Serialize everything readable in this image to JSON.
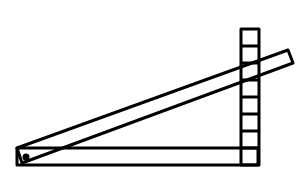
{
  "diagram": {
    "stroke_color": "#000000",
    "background": "#ffffff",
    "column_cells": 8
  }
}
